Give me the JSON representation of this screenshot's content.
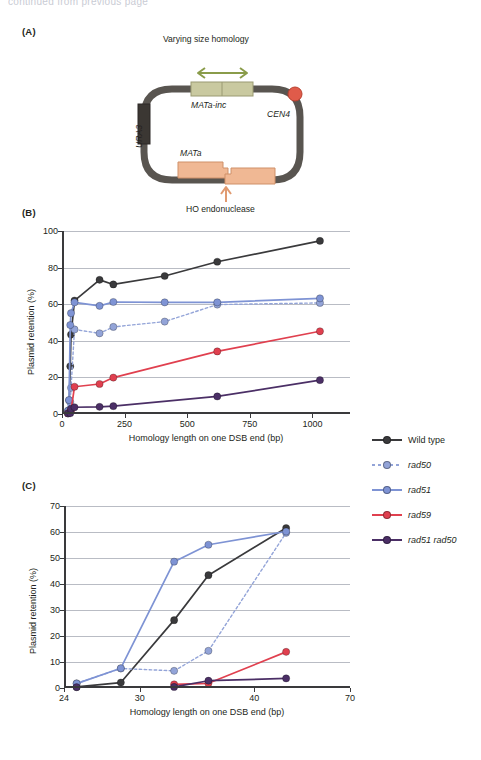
{
  "page": {
    "top_fragment": "continued from previous page"
  },
  "panels": {
    "a": {
      "label": "(A)"
    },
    "b": {
      "label": "(B)"
    },
    "c": {
      "label": "(C)"
    }
  },
  "diagram": {
    "varying_homology_label": "Varying size homology",
    "mata_inc_label": "MATa-inc",
    "cen4_label": "CEN4",
    "ura3_label": "URA3",
    "mata_label": "MATa",
    "ho_label": "HO endonuclease",
    "colors": {
      "backbone": "#595550",
      "homology_box": "#c9c9a0",
      "mat_box": "#f0b894",
      "centromere": "#e05b4a",
      "arrow": "#8a9c4a",
      "ho_arrow": "#e09a70"
    }
  },
  "series_colors": {
    "wild_type": "#3a3a3c",
    "rad50": "#93a4d8",
    "rad51": "#7e93d4",
    "rad59": "#e0404f",
    "rad51_rad50": "#4b2f66"
  },
  "legend": {
    "items": [
      {
        "label": "Wild type",
        "color_key": "wild_type",
        "dashed": false,
        "italic": false
      },
      {
        "label": "rad50",
        "color_key": "rad50",
        "dashed": true,
        "italic": true
      },
      {
        "label": "rad51",
        "color_key": "rad51",
        "dashed": false,
        "italic": true
      },
      {
        "label": "rad59",
        "color_key": "rad59",
        "dashed": false,
        "italic": true
      },
      {
        "label": "rad51 rad50",
        "color_key": "rad51_rad50",
        "dashed": false,
        "italic": true
      }
    ]
  },
  "chart_data": [
    {
      "panel": "B",
      "type": "line",
      "title": "",
      "xlabel": "Homology length on one DSB end (bp)",
      "ylabel": "Plasmid retention (%)",
      "xlim": [
        0,
        1150
      ],
      "ylim": [
        0,
        100
      ],
      "xticks": [
        0,
        250,
        500,
        750,
        1000
      ],
      "yticks": [
        0,
        20,
        40,
        60,
        80,
        100
      ],
      "grid": true,
      "legend_position": "right",
      "series": [
        {
          "name": "Wild type",
          "color_key": "wild_type",
          "dashed": false,
          "x": [
            24,
            28,
            33,
            36,
            50,
            150,
            205,
            410,
            620,
            1030
          ],
          "y": [
            0.4,
            2.1,
            26.1,
            43.4,
            62.0,
            73.3,
            70.8,
            75.4,
            83.2,
            94.6
          ]
        },
        {
          "name": "rad50",
          "color_key": "rad50",
          "dashed": true,
          "x": [
            24,
            28,
            33,
            36,
            50,
            150,
            205,
            410,
            620,
            1030
          ],
          "y": [
            1.8,
            7.5,
            6.6,
            14.3,
            46.2,
            44.1,
            47.6,
            50.5,
            59.8,
            60.7
          ]
        },
        {
          "name": "rad51",
          "color_key": "rad51",
          "dashed": false,
          "x": [
            24,
            28,
            33,
            36,
            50,
            150,
            205,
            410,
            620,
            1030
          ],
          "y": [
            1.7,
            7.6,
            48.6,
            55.1,
            61.0,
            59.1,
            61.2,
            61.0,
            61.0,
            63.2
          ]
        },
        {
          "name": "rad59",
          "color_key": "rad59",
          "dashed": false,
          "x": [
            24,
            33,
            36,
            50,
            150,
            205,
            620,
            1030
          ],
          "y": [
            0.3,
            1.4,
            1.8,
            14.9,
            16.4,
            19.9,
            34.2,
            45.2
          ]
        },
        {
          "name": "rad51 rad50",
          "color_key": "rad51_rad50",
          "dashed": false,
          "x": [
            24,
            33,
            36,
            50,
            150,
            205,
            620,
            1030
          ],
          "y": [
            0.3,
            0.4,
            2.8,
            3.7,
            3.9,
            4.3,
            9.6,
            18.5
          ]
        }
      ]
    },
    {
      "panel": "C",
      "type": "line",
      "title": "",
      "xlabel": "Homology length on one DSB end (bp)",
      "ylabel": "Plasmid retention (%)",
      "xlim": [
        24,
        70
      ],
      "ylim": [
        0,
        70
      ],
      "xticks": [
        24,
        30,
        40,
        70
      ],
      "yticks": [
        0,
        10,
        20,
        30,
        40,
        50,
        60,
        70
      ],
      "x_scale": "nonlinear",
      "grid": true,
      "legend_position": "right",
      "note": "Zoomed view of the short-homology region of panel B",
      "series": [
        {
          "name": "Wild type",
          "color_key": "wild_type",
          "dashed": false,
          "x": [
            25,
            28.5,
            33,
            36,
            50
          ],
          "y": [
            0.4,
            2.1,
            26.1,
            43.4,
            61.5
          ]
        },
        {
          "name": "rad50",
          "color_key": "rad50",
          "dashed": true,
          "x": [
            25,
            28.5,
            33,
            36,
            50
          ],
          "y": [
            1.8,
            7.5,
            6.6,
            14.3,
            59.7
          ]
        },
        {
          "name": "rad51",
          "color_key": "rad51",
          "dashed": false,
          "x": [
            25,
            28.5,
            33,
            36,
            50
          ],
          "y": [
            1.7,
            7.6,
            48.6,
            55.1,
            60.2
          ]
        },
        {
          "name": "rad59",
          "color_key": "rad59",
          "dashed": false,
          "x": [
            33,
            36,
            50
          ],
          "y": [
            1.4,
            1.8,
            13.9
          ]
        },
        {
          "name": "rad51 rad50",
          "color_key": "rad51_rad50",
          "dashed": false,
          "x": [
            25,
            33,
            36,
            50
          ],
          "y": [
            0.3,
            0.4,
            2.8,
            3.7
          ]
        }
      ]
    }
  ]
}
